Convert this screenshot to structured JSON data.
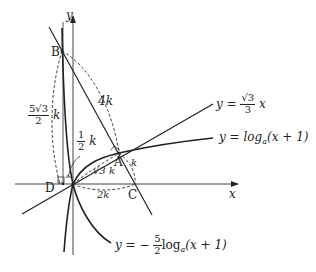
{
  "axes": {
    "x_label": "x",
    "y_label": "y"
  },
  "points": {
    "A": "A",
    "B": "B",
    "C": "C",
    "D": "D"
  },
  "curves": {
    "line1": {
      "lhs": "y =",
      "num": "√3",
      "den": "3",
      "var": "x"
    },
    "log1": {
      "text": "y = log",
      "sub": "a",
      "arg": "(x + 1)"
    },
    "log2": {
      "lhs": "y = −",
      "num": "5",
      "den": "2",
      "text": "log",
      "sub": "a",
      "arg": "(x + 1)"
    }
  },
  "segments": {
    "AB": "4k",
    "BD_num": "5√3",
    "BD_den": "2",
    "BD_k": "k",
    "half_num": "1",
    "half_den": "2",
    "half_k": "k",
    "OA": "√3 k",
    "AC": "k",
    "OC": "2k"
  },
  "colors": {
    "stroke": "#222222",
    "dash": "#333333"
  }
}
